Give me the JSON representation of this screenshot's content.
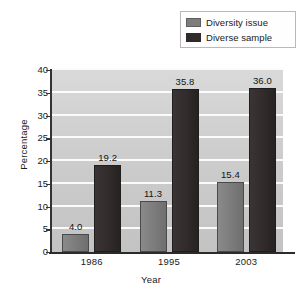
{
  "chart_data": {
    "type": "bar",
    "title": "",
    "subtitle": "",
    "xlabel": "Year",
    "ylabel": "Percentage",
    "categories": [
      "1986",
      "1995",
      "2003"
    ],
    "series": [
      {
        "name": "Diversity issue",
        "color": "#7d7d7d",
        "values": [
          4.0,
          11.3,
          15.4
        ],
        "labels": [
          "4.0",
          "11.3",
          "15.4"
        ]
      },
      {
        "name": "Diverse sample",
        "color": "#2f2b2b",
        "values": [
          19.2,
          35.8,
          36.0
        ],
        "labels": [
          "19.2",
          "35.8",
          "36.0"
        ]
      }
    ],
    "ylim": [
      0,
      40
    ],
    "yticks": [
      0,
      5,
      10,
      15,
      20,
      25,
      30,
      35,
      40
    ],
    "ytick_labels": [
      "0",
      "5",
      "10",
      "15",
      "20",
      "25",
      "30",
      "35",
      "40"
    ],
    "grid": true,
    "grid_orientation": "horizontal",
    "grid_color": "#fbfbfb",
    "plot_background": "#cfcfcf",
    "legend_position": "top-right",
    "data_labels": true
  },
  "legend": {
    "entries": [
      {
        "label": "Diversity issue",
        "swatch": "series-a"
      },
      {
        "label": "Diverse sample",
        "swatch": "series-b"
      }
    ]
  },
  "axes": {
    "y_title": "Percentage",
    "x_title": "Year"
  }
}
